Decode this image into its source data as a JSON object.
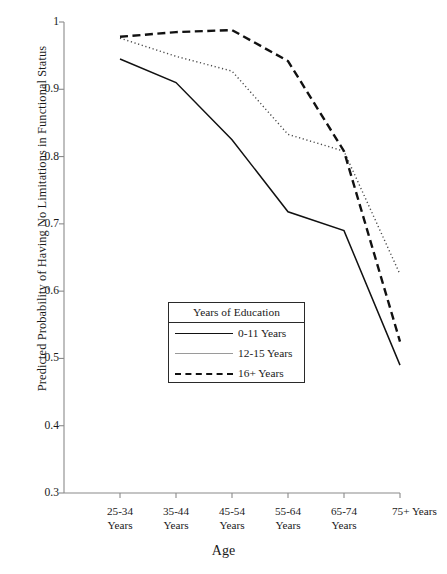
{
  "chart_data": {
    "type": "line",
    "title": "",
    "xlabel": "Age",
    "ylabel": "Predicted Probability of Having No Limitations in Functional Status",
    "categories": [
      "25-34 Years",
      "35-44 Years",
      "45-54 Years",
      "55-64 Years",
      "65-74 Years",
      "75+ Years"
    ],
    "category_lines": [
      [
        "25-34",
        "Years"
      ],
      [
        "35-44",
        "Years"
      ],
      [
        "45-54",
        "Years"
      ],
      [
        "55-64",
        "Years"
      ],
      [
        "65-74",
        "Years"
      ],
      [
        "75+ Years"
      ]
    ],
    "ylim": [
      0.3,
      1.0
    ],
    "yticks": [
      "0.3",
      "0.4",
      "0.5",
      "0.6",
      "0.7",
      "0.8",
      "0.9",
      "1"
    ],
    "ytick_values": [
      0.3,
      0.4,
      0.5,
      0.6,
      0.7,
      0.8,
      0.9,
      1.0
    ],
    "grid": false,
    "legend_position": "center",
    "legend_title": "Years of Education",
    "series": [
      {
        "name": "0-11 Years",
        "style": "solid-thick",
        "color": "#111111",
        "values": [
          0.945,
          0.91,
          0.825,
          0.718,
          0.69,
          0.49
        ]
      },
      {
        "name": "12-15 Years",
        "style": "dotted",
        "color": "#555555",
        "values": [
          0.976,
          0.949,
          0.927,
          0.833,
          0.808,
          0.625
        ]
      },
      {
        "name": "16+ Years",
        "style": "dashed-thick",
        "color": "#111111",
        "values": [
          0.978,
          0.985,
          0.988,
          0.942,
          0.808,
          0.525
        ]
      }
    ]
  },
  "legend": {
    "title": "Years of Education",
    "rows": [
      {
        "label": "0-11 Years",
        "swatch": "solid-thick"
      },
      {
        "label": "12-15 Years",
        "swatch": "solid-thin"
      },
      {
        "label": "16+ Years",
        "swatch": "dashed"
      }
    ]
  }
}
